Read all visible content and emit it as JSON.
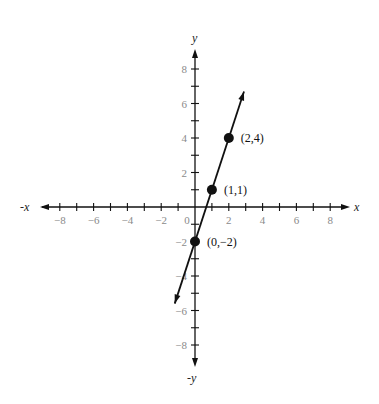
{
  "chart_data": {
    "type": "line",
    "title": "",
    "equation": "y = 3x - 2",
    "xlabel": "x",
    "ylabel": "y",
    "x_neg_label": "-x",
    "y_neg_label": "-y",
    "xlim": [
      -9,
      9
    ],
    "ylim": [
      -9,
      9
    ],
    "grid": false,
    "x_ticks": [
      -8,
      -7,
      -6,
      -5,
      -4,
      -3,
      -2,
      -1,
      1,
      2,
      3,
      4,
      5,
      6,
      7,
      8
    ],
    "x_tick_labels": [
      -8,
      -6,
      -4,
      -2,
      2,
      4,
      6,
      8
    ],
    "y_ticks": [
      -8,
      -7,
      -6,
      -5,
      -4,
      -3,
      -2,
      -1,
      1,
      2,
      3,
      4,
      5,
      6,
      7,
      8
    ],
    "y_tick_labels": [
      -8,
      -6,
      -4,
      -2,
      2,
      4,
      6,
      8
    ],
    "origin_label": "0",
    "line": {
      "x_start": -1.2,
      "y_start": -5.6,
      "x_end": 2.9,
      "y_end": 6.7
    },
    "points": [
      {
        "x": 2,
        "y": 4,
        "label": "(2,4)"
      },
      {
        "x": 1,
        "y": 1,
        "label": "(1,1)"
      },
      {
        "x": 0,
        "y": -2,
        "label": "(0,−2)"
      }
    ]
  }
}
